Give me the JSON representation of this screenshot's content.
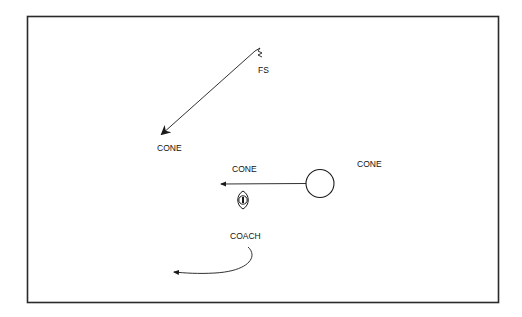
{
  "diagram": {
    "type": "football-drill",
    "colors": {
      "line": "#1a1a1a",
      "background": "#ffffff",
      "frame": "#2a2a2a"
    },
    "labels": {
      "free_safety": "FS",
      "cone_left": "CONE",
      "cone_middle": "CONE",
      "cone_right": "CONE",
      "coach": "COACH"
    },
    "elements": [
      {
        "id": "fs-player",
        "symbol": "squiggle",
        "label": "FS"
      },
      {
        "id": "fs-route",
        "kind": "arrow",
        "direction": "down-left",
        "to": "CONE"
      },
      {
        "id": "receiver",
        "symbol": "circle"
      },
      {
        "id": "receiver-route",
        "kind": "arrow",
        "direction": "left"
      },
      {
        "id": "ball",
        "symbol": "football"
      },
      {
        "id": "coach-route",
        "kind": "curved-arrow",
        "direction": "down-left"
      }
    ]
  }
}
